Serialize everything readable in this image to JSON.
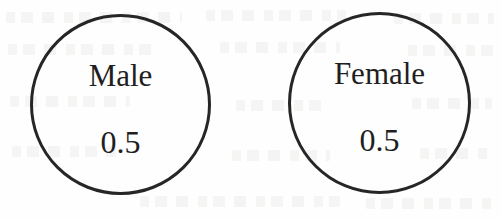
{
  "figure": {
    "type": "probability-circles",
    "background_color": "#fefefe",
    "stroke_color": "#262626",
    "text_color": "#1f1f1f",
    "circles": [
      {
        "id": "male",
        "label": "Male",
        "value": "0.5"
      },
      {
        "id": "female",
        "label": "Female",
        "value": "0.5"
      }
    ]
  },
  "chart_data": {
    "type": "pie",
    "title": "",
    "subtitle": "",
    "xlabel": "",
    "ylabel": "",
    "categories": [
      "Male",
      "Female"
    ],
    "values": [
      0.5,
      0.5
    ],
    "value_labels": [
      "0.5",
      "0.5"
    ],
    "legend": [],
    "legend_position": "none",
    "grid": false
  }
}
